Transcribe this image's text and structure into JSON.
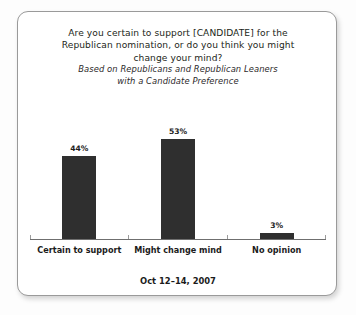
{
  "card": {
    "title_lines": [
      "Are you certain to support [CANDIDATE] for the",
      "Republican nomination, or do you think you might",
      "change your mind?"
    ],
    "subtitle_lines": [
      "Based on Republicans and Republican Leaners",
      "with a Candidate Preference"
    ],
    "footer": "Oct 12–14, 2007"
  },
  "chart_data": {
    "type": "bar",
    "title": "Are you certain to support [CANDIDATE] for the Republican nomination, or do you think you might change your mind?",
    "subtitle": "Based on Republicans and Republican Leaners with a Candidate Preference",
    "categories": [
      "Certain to support",
      "Might change mind",
      "No opinion"
    ],
    "values": [
      44,
      53,
      3
    ],
    "value_labels": [
      "44%",
      "53%",
      "3%"
    ],
    "xlabel": "",
    "ylabel": "",
    "ylim": [
      0,
      62
    ],
    "grid": false,
    "legend": false,
    "bar_color": "#2f2f2f",
    "axis_color": "#6f6f6f",
    "footnote": "Oct 12–14, 2007"
  }
}
